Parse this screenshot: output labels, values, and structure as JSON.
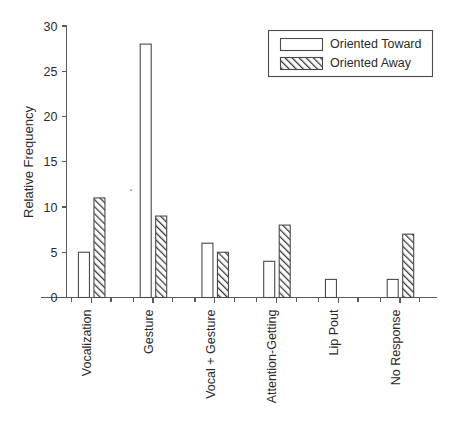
{
  "chart_data": {
    "type": "bar",
    "title": "",
    "subtitle": "",
    "xlabel": "",
    "ylabel": "Relative Frequency",
    "categories": [
      "Vocalization",
      "Gesture",
      "Vocal + Gesture",
      "Attention-Getting",
      "Lip Pout",
      "No Response"
    ],
    "series": [
      {
        "name": "Oriented Toward",
        "style": "open",
        "values": [
          5,
          28,
          6,
          4,
          2,
          2
        ]
      },
      {
        "name": "Oriented Away",
        "style": "hatched",
        "values": [
          11,
          9,
          5,
          8,
          0,
          7
        ]
      }
    ],
    "ylim": [
      0,
      30
    ],
    "yticks": [
      0,
      5,
      10,
      15,
      20,
      25,
      30
    ],
    "ytick_labels": [
      "0",
      "5",
      "10",
      "15",
      "20",
      "25",
      "30"
    ],
    "grid": false,
    "legend_position": "top-right",
    "legend_entries": [
      "Oriented Toward",
      "Oriented Away"
    ],
    "colors": {
      "bar_open_fill": "#ffffff",
      "bar_stroke": "#4a4a4a",
      "hatch_stroke": "#3c3c3c",
      "axis": "#5a5a5a",
      "text": "#2b2b2b",
      "background": "#ffffff"
    }
  }
}
